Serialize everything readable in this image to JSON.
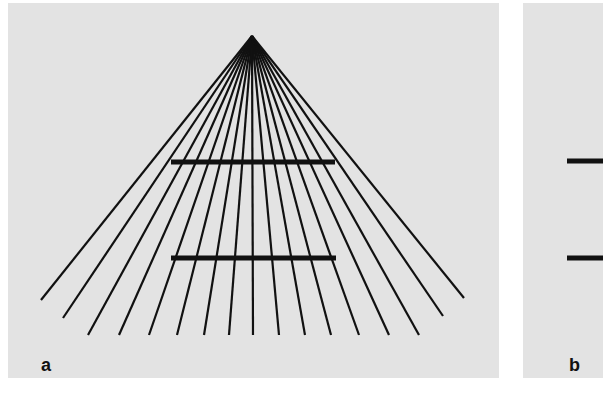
{
  "figure": {
    "panels": [
      {
        "id": "a",
        "label": "a",
        "description": "Ponzo illusion: 17 converging lines radiating from an apex with two equal-length horizontal bars",
        "apex": [
          244,
          33
        ],
        "ray_endpoints": [
          [
            33,
            297
          ],
          [
            55,
            315
          ],
          [
            80,
            332
          ],
          [
            111,
            332
          ],
          [
            141,
            332
          ],
          [
            169,
            332
          ],
          [
            196,
            332
          ],
          [
            221,
            332
          ],
          [
            245,
            332
          ],
          [
            271,
            332
          ],
          [
            297,
            332
          ],
          [
            323,
            332
          ],
          [
            351,
            332
          ],
          [
            381,
            332
          ],
          [
            411,
            332
          ],
          [
            435,
            313
          ],
          [
            456,
            295
          ]
        ],
        "bars": [
          {
            "x1": 163,
            "x2": 327,
            "y": 159
          },
          {
            "x1": 163,
            "x2": 328,
            "y": 255
          }
        ]
      },
      {
        "id": "b",
        "label": "b",
        "description": "Two horizontal bars without converging context",
        "bars": [
          {
            "x1": 44,
            "x2": 80,
            "y": 158
          },
          {
            "x1": 44,
            "x2": 80,
            "y": 255
          }
        ]
      }
    ],
    "colors": {
      "panel_bg": "#e3e3e3",
      "ink": "#111111",
      "page_bg": "#ffffff"
    }
  }
}
